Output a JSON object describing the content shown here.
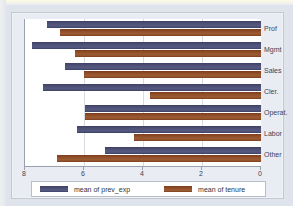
{
  "chart_data": {
    "type": "bar",
    "orientation": "horizontal",
    "title": "",
    "subtitle": "",
    "xlabel": "",
    "ylabel": "",
    "xlim": [
      8,
      0
    ],
    "x_axis_reversed": true,
    "grid": true,
    "xticks": [
      8,
      6,
      4,
      2,
      0
    ],
    "xtick_labels": [
      "8",
      "6",
      "4",
      "2",
      "0"
    ],
    "categories": [
      "Prof",
      "Mgmt",
      "Sales",
      "Cler.",
      "Operat.",
      "Labor",
      "Other"
    ],
    "series": [
      {
        "name": "mean of prev_exp",
        "color": "#4e5076",
        "values": [
          7.25,
          7.77,
          6.65,
          7.4,
          5.98,
          6.25,
          5.3
        ]
      },
      {
        "name": "mean of tenure",
        "color": "#92502a",
        "values": [
          6.8,
          6.3,
          6.0,
          3.75,
          5.98,
          4.3,
          6.9
        ]
      }
    ],
    "legend": {
      "position": "bottom",
      "entries": [
        "mean of prev_exp",
        "mean of tenure"
      ]
    },
    "colors": {
      "prev_exp": "#4e5076",
      "tenure": "#92502a",
      "plot_background": "#ffffff",
      "figure_background": "#e9ecf2",
      "axis": "#9aa0ac",
      "gridline": "#d7dbe2",
      "text": "#3e4352"
    }
  }
}
